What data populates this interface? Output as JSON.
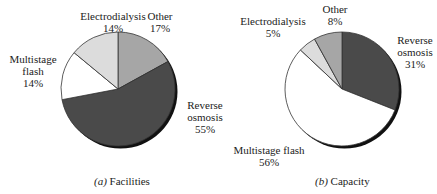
{
  "chart_data": [
    {
      "type": "pie",
      "title": "(a) Facilities",
      "caption_letter": "a",
      "caption_text": "Facilities",
      "slices": [
        {
          "label": "Other",
          "value": 17,
          "color": "#a6a6a6"
        },
        {
          "label": "Reverse osmosis",
          "value": 55,
          "color": "#4a4a4a"
        },
        {
          "label": "Multistage flash",
          "value": 14,
          "color": "#ffffff"
        },
        {
          "label": "Electrodialysis",
          "value": 14,
          "color": "#dcdcdc"
        }
      ]
    },
    {
      "type": "pie",
      "title": "(b) Capacity",
      "caption_letter": "b",
      "caption_text": "Capacity",
      "slices": [
        {
          "label": "Reverse osmosis",
          "value": 31,
          "color": "#4a4a4a"
        },
        {
          "label": "Multistage flash",
          "value": 56,
          "color": "#ffffff"
        },
        {
          "label": "Electrodialysis",
          "value": 5,
          "color": "#dcdcdc"
        },
        {
          "label": "Other",
          "value": 8,
          "color": "#a6a6a6"
        }
      ]
    }
  ],
  "labels": {
    "a": {
      "electrodialysis": {
        "name": "Electrodialysis",
        "pct": "14%"
      },
      "other": {
        "name": "Other",
        "pct": "17%"
      },
      "multistage": {
        "line1": "Multistage",
        "line2": "flash",
        "pct": "14%"
      },
      "reverse": {
        "line1": "Reverse",
        "line2": "osmosis",
        "pct": "55%"
      }
    },
    "b": {
      "electrodialysis": {
        "name": "Electrodialysis",
        "pct": "5%"
      },
      "other": {
        "name": "Other",
        "pct": "8%"
      },
      "multistage": {
        "name": "Multistage flash",
        "pct": "56%"
      },
      "reverse": {
        "line1": "Reverse",
        "line2": "osmosis",
        "pct": "31%"
      }
    }
  },
  "captions": {
    "a": {
      "letter": "(a)",
      "text": " Facilities"
    },
    "b": {
      "letter": "(b)",
      "text": " Capacity"
    }
  }
}
